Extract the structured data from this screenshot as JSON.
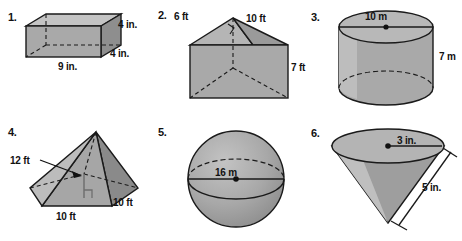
{
  "page": {
    "background_color": "#ffffff",
    "fill_light": "#c9c9c9",
    "fill_mid": "#a8a8a8",
    "fill_dark": "#8c8c8c",
    "stroke_color": "#1a1a1a",
    "text_color": "#111111"
  },
  "problems": [
    {
      "number": "1.",
      "shape": "rectangular-prism",
      "shape_name": "rectangular prism",
      "labels": [
        {
          "text": "9 in.",
          "role": "length"
        },
        {
          "text": "4 in.",
          "role": "height"
        },
        {
          "text": "4 in.",
          "role": "depth"
        }
      ]
    },
    {
      "number": "2.",
      "shape": "triangular-prism",
      "shape_name": "triangular prism",
      "labels": [
        {
          "text": "6 ft",
          "role": "triangle-leg"
        },
        {
          "text": "10 ft",
          "role": "triangle-leg"
        },
        {
          "text": "7 ft",
          "role": "prism-height"
        }
      ]
    },
    {
      "number": "3.",
      "shape": "cylinder",
      "shape_name": "cylinder",
      "labels": [
        {
          "text": "10 m",
          "role": "diameter"
        },
        {
          "text": "7 m",
          "role": "height"
        }
      ]
    },
    {
      "number": "4.",
      "shape": "square-pyramid",
      "shape_name": "square pyramid",
      "labels": [
        {
          "text": "12 ft",
          "role": "height"
        },
        {
          "text": "10 ft",
          "role": "base-edge-front"
        },
        {
          "text": "10 ft",
          "role": "base-edge-right"
        }
      ]
    },
    {
      "number": "5.",
      "shape": "sphere",
      "shape_name": "sphere",
      "labels": [
        {
          "text": "16 m",
          "role": "diameter"
        }
      ]
    },
    {
      "number": "6.",
      "shape": "cone",
      "shape_name": "inverted cone",
      "labels": [
        {
          "text": "3 in.",
          "role": "radius"
        },
        {
          "text": "5 in.",
          "role": "slant-height"
        }
      ]
    }
  ]
}
